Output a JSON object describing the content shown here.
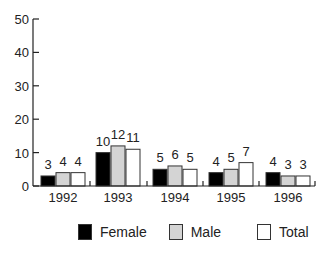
{
  "chart_data": {
    "type": "bar",
    "title": "",
    "xlabel": "",
    "ylabel": "",
    "ylim": [
      0,
      50
    ],
    "yticks": [
      0,
      10,
      20,
      30,
      40,
      50
    ],
    "grid": false,
    "legend_position": "bottom",
    "categories": [
      "1992",
      "1993",
      "1994",
      "1995",
      "1996"
    ],
    "series": [
      {
        "name": "Female",
        "color": "#000000",
        "values": [
          3,
          10,
          5,
          4,
          4
        ]
      },
      {
        "name": "Male",
        "color": "#d4d4d4",
        "values": [
          4,
          12,
          6,
          5,
          3
        ]
      },
      {
        "name": "Total",
        "color": "#ffffff",
        "values": [
          4,
          11,
          5,
          7,
          3
        ]
      }
    ]
  },
  "legend": {
    "items": [
      {
        "label": "Female",
        "color": "#000000"
      },
      {
        "label": "Male",
        "color": "#d4d4d4"
      },
      {
        "label": "Total",
        "color": "#ffffff"
      }
    ]
  }
}
